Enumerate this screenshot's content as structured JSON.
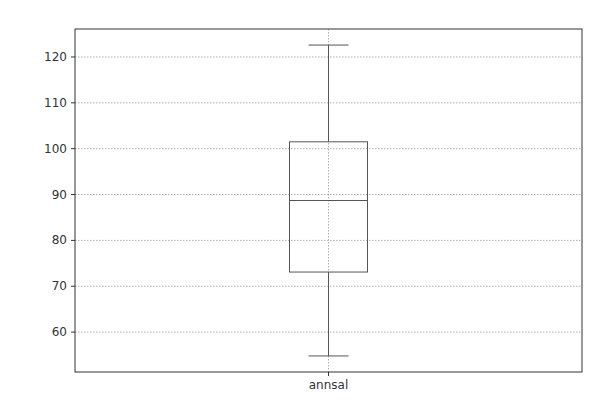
{
  "chart_data": {
    "type": "box",
    "title": "",
    "xlabel": "",
    "ylabel": "",
    "categories": [
      "annsal"
    ],
    "series": [
      {
        "name": "annsal",
        "whisker_low": 54.8,
        "q1": 73.1,
        "median": 88.7,
        "q3": 101.5,
        "whisker_high": 122.6,
        "outliers": []
      }
    ],
    "ylim": [
      51.3,
      126.1
    ],
    "yticks": [
      60,
      70,
      80,
      90,
      100,
      110,
      120
    ],
    "ytick_labels": [
      "60",
      "70",
      "80",
      "90",
      "100",
      "110",
      "120"
    ],
    "grid": true,
    "legend": null
  },
  "colors": {
    "frame": "#333333",
    "box": "#555555",
    "grid": "#b0b0b0",
    "text": "#333333"
  }
}
